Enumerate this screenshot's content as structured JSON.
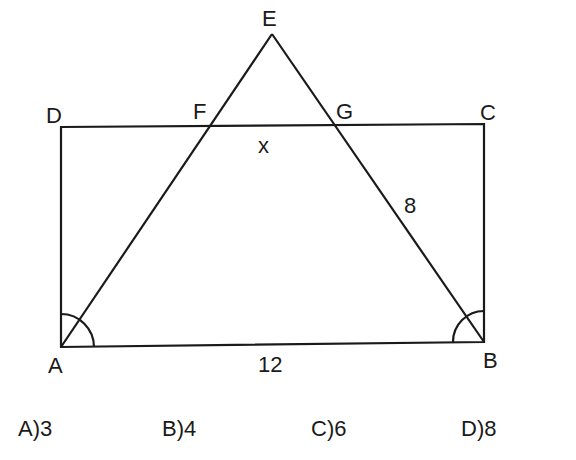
{
  "figure": {
    "points": {
      "A": "A",
      "B": "B",
      "C": "C",
      "D": "D",
      "E": "E",
      "F": "F",
      "G": "G"
    },
    "labels": {
      "x": "x",
      "eg": "8",
      "ab": "12"
    },
    "stroke_color": "#1a1a1a"
  },
  "options": [
    {
      "letter": "A)",
      "value": "3"
    },
    {
      "letter": "B)",
      "value": "4"
    },
    {
      "letter": "C)",
      "value": "6"
    },
    {
      "letter": "D)",
      "value": "8"
    }
  ]
}
